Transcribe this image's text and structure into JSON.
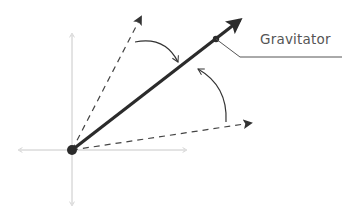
{
  "diagram": {
    "label": "Gravitator",
    "colors": {
      "axis": "#c8c8c8",
      "main_vector": "#2b2b2b",
      "dashed": "#444444",
      "curve": "#333333",
      "leader": "#555555",
      "text": "#555555"
    },
    "origin": [
      72,
      150
    ],
    "main_vector_tip": [
      241,
      19
    ],
    "upper_dashed_tip": [
      143,
      13
    ],
    "lower_dashed_tip": [
      255,
      122
    ],
    "gravitator_point": [
      216,
      39
    ]
  }
}
